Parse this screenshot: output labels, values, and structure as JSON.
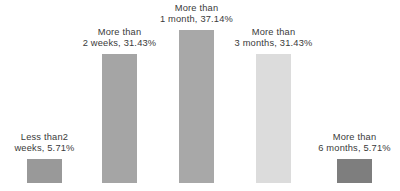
{
  "chart_data": {
    "type": "bar",
    "title": "",
    "subtitle": "",
    "xlabel": "",
    "ylabel": "",
    "ylim": [
      0,
      37.14
    ],
    "grid": false,
    "legend": "none",
    "axes_visible": false,
    "data_labels_position": "above-bar",
    "categories": [
      "Less than2 weeks",
      "More than 2 weeks",
      "More than 1 month",
      "More than 3 months",
      "More than 6 months"
    ],
    "values": [
      5.71,
      31.43,
      37.14,
      31.43,
      5.71
    ],
    "value_labels": [
      "5.71%",
      "31.43%",
      "37.14%",
      "31.43%",
      "5.71%"
    ],
    "bar_colors": [
      "#999999",
      "#a5a5a5",
      "#a8a8a8",
      "#dcdcdc",
      "#7e7e7e"
    ],
    "points": [
      {
        "category": "Less than2 weeks",
        "value": 5.71,
        "label_line1": "Less than2",
        "label_line2": "weeks, 5.71%",
        "color": "#999999"
      },
      {
        "category": "More than 2 weeks",
        "value": 31.43,
        "label_line1": "More than",
        "label_line2": "2 weeks, 31.43%",
        "color": "#a5a5a5"
      },
      {
        "category": "More than 1 month",
        "value": 37.14,
        "label_line1": "More than",
        "label_line2": "1 month, 37.14%",
        "color": "#a8a8a8"
      },
      {
        "category": "More than 3 months",
        "value": 31.43,
        "label_line1": "More than",
        "label_line2": "3 months, 31.43%",
        "color": "#dcdcdc"
      },
      {
        "category": "More than 6 months",
        "value": 5.71,
        "label_line1": "More than",
        "label_line2": "6 months, 5.71%",
        "color": "#7e7e7e"
      }
    ]
  }
}
